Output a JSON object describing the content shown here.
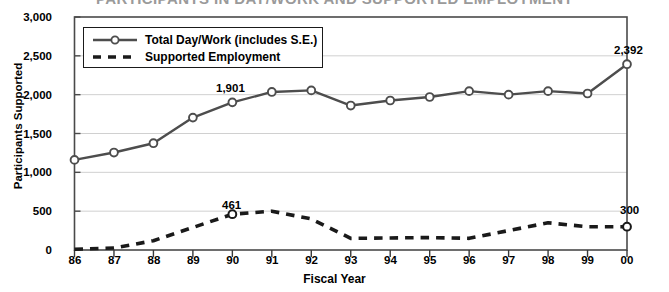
{
  "title": "PARTICIPANTS IN DAY/WORK AND SUPPORTED EMPLOYMENT",
  "axis": {
    "ylabel": "Participants Supported",
    "xlabel": "Fiscal Year"
  },
  "legend": {
    "items": [
      {
        "label": "Total Day/Work (includes S.E.)",
        "style": "solid-circle-marker",
        "color": "#4d4d4d"
      },
      {
        "label": "Supported Employment",
        "style": "dashed",
        "color": "#1a1a1a"
      }
    ]
  },
  "annotations": [
    {
      "text": "1,901",
      "series": "Total Day/Work (includes S.E.)",
      "x": "90",
      "value": 1901
    },
    {
      "text": "2,392",
      "series": "Total Day/Work (includes S.E.)",
      "x": "00",
      "value": 2392
    },
    {
      "text": "461",
      "series": "Supported Employment",
      "x": "90",
      "value": 461
    },
    {
      "text": "300",
      "series": "Supported Employment",
      "x": "00",
      "value": 300
    }
  ],
  "chart_data": {
    "type": "line",
    "title": "PARTICIPANTS IN DAY/WORK AND SUPPORTED EMPLOYMENT",
    "xlabel": "Fiscal Year",
    "ylabel": "Participants Supported",
    "categories": [
      "86",
      "87",
      "88",
      "89",
      "90",
      "91",
      "92",
      "93",
      "94",
      "95",
      "96",
      "97",
      "98",
      "99",
      "00"
    ],
    "ylim": [
      0,
      3000
    ],
    "yticks": [
      0,
      500,
      1000,
      1500,
      2000,
      2500,
      3000
    ],
    "ytick_labels": [
      "0",
      "500",
      "1,000",
      "1,500",
      "2,000",
      "2,500",
      "3,000"
    ],
    "grid": true,
    "legend_position": "upper-left-inside",
    "series": [
      {
        "name": "Total Day/Work (includes S.E.)",
        "color": "#4d4d4d",
        "marker": "open-circle",
        "dash": "solid",
        "values": [
          1160,
          1255,
          1375,
          1705,
          1901,
          2035,
          2055,
          1860,
          1925,
          1970,
          2045,
          2000,
          2045,
          2015,
          2392
        ]
      },
      {
        "name": "Supported Employment",
        "color": "#1a1a1a",
        "marker": "open-circle",
        "dash": "dashed",
        "values": [
          10,
          25,
          120,
          290,
          461,
          500,
          400,
          150,
          155,
          160,
          150,
          250,
          350,
          300,
          300
        ]
      }
    ]
  }
}
